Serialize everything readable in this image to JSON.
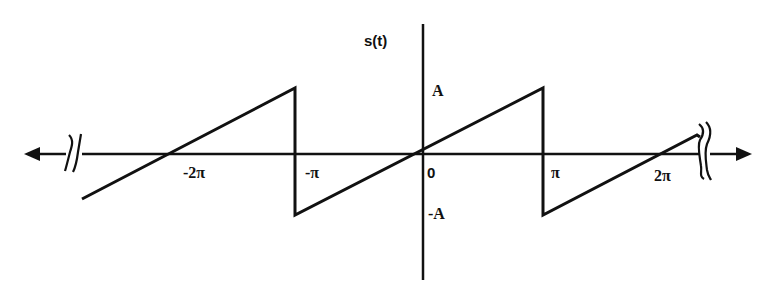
{
  "diagram": {
    "y_axis_label": "s(t)",
    "amplitude_labels": {
      "positive": "A",
      "negative": "-A"
    },
    "x_tick_labels": [
      "-2π",
      "-π",
      "0",
      "π",
      "2π"
    ],
    "origin_label": "0",
    "colors": {
      "stroke": "#111111",
      "background": "#ffffff"
    },
    "waveform": {
      "type": "sawtooth",
      "period": "2π",
      "description": "Linear ramp from -A to A over (-π, π), vertical drop at odd multiples of π",
      "points": [
        {
          "t": "-2.8π",
          "s": "-0.8A"
        },
        {
          "t": "-π",
          "s": "A"
        },
        {
          "t": "-π",
          "s": "-A"
        },
        {
          "t": "π",
          "s": "A"
        },
        {
          "t": "π",
          "s": "-A"
        },
        {
          "t": "2.4π",
          "s": "0.4A"
        }
      ]
    },
    "axis_breaks": [
      "left",
      "right"
    ]
  }
}
